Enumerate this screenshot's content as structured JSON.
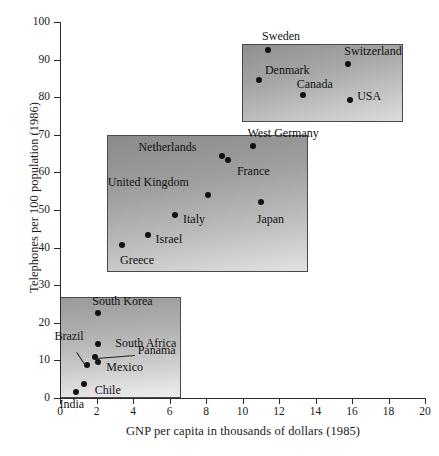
{
  "chart_data": {
    "type": "scatter",
    "title": "",
    "xlabel": "GNP per capita in thousands of dollars (1985)",
    "ylabel": "Telephones per 100 population (1986)",
    "xlim": [
      0,
      20
    ],
    "ylim": [
      0,
      100
    ],
    "xticks": [
      0,
      2,
      4,
      6,
      8,
      10,
      12,
      14,
      16,
      18,
      20
    ],
    "yticks": [
      0,
      10,
      20,
      30,
      40,
      50,
      60,
      70,
      80,
      90,
      100
    ],
    "grid": false,
    "legend": "none",
    "points": [
      {
        "label": "Sweden",
        "x": 11.4,
        "y": 92.5,
        "group": "high"
      },
      {
        "label": "Switzerland",
        "x": 15.8,
        "y": 88.8,
        "group": "high"
      },
      {
        "label": "Denmark",
        "x": 10.9,
        "y": 84.5,
        "group": "high"
      },
      {
        "label": "Canada",
        "x": 13.3,
        "y": 80.5,
        "group": "high"
      },
      {
        "label": "USA",
        "x": 15.9,
        "y": 79.2,
        "group": "high"
      },
      {
        "label": "West Germany",
        "x": 10.6,
        "y": 67.0,
        "group": "mid"
      },
      {
        "label": "Netherlands",
        "x": 8.9,
        "y": 64.4,
        "group": "mid"
      },
      {
        "label": "France",
        "x": 9.2,
        "y": 63.3,
        "group": "mid"
      },
      {
        "label": "United Kingdom",
        "x": 8.1,
        "y": 54.1,
        "group": "mid"
      },
      {
        "label": "Japan",
        "x": 11.0,
        "y": 52.1,
        "group": "mid"
      },
      {
        "label": "Italy",
        "x": 6.3,
        "y": 48.7,
        "group": "mid"
      },
      {
        "label": "Israel",
        "x": 4.8,
        "y": 43.4,
        "group": "mid"
      },
      {
        "label": "Greece",
        "x": 3.4,
        "y": 40.6,
        "group": "mid"
      },
      {
        "label": "South Korea",
        "x": 2.1,
        "y": 22.7,
        "group": "low"
      },
      {
        "label": "South Africa",
        "x": 2.1,
        "y": 14.3,
        "group": "low"
      },
      {
        "label": "Panama",
        "x": 1.9,
        "y": 10.9,
        "group": "low"
      },
      {
        "label": "Mexico",
        "x": 2.1,
        "y": 9.5,
        "group": "low"
      },
      {
        "label": "Brazil",
        "x": 1.5,
        "y": 8.7,
        "group": "low"
      },
      {
        "label": "Chile",
        "x": 1.3,
        "y": 3.6,
        "group": "low"
      },
      {
        "label": "India",
        "x": 0.9,
        "y": 1.7,
        "group": "low"
      }
    ],
    "groups": [
      {
        "name": "high-income",
        "members": [
          "Sweden",
          "Switzerland",
          "Denmark",
          "Canada",
          "USA"
        ]
      },
      {
        "name": "middle-income",
        "members": [
          "West Germany",
          "Netherlands",
          "France",
          "United Kingdom",
          "Japan",
          "Italy",
          "Israel",
          "Greece"
        ]
      },
      {
        "name": "low-income",
        "members": [
          "South Korea",
          "South Africa",
          "Panama",
          "Mexico",
          "Brazil",
          "Chile",
          "India"
        ]
      }
    ]
  },
  "colors": {
    "axis": "#2a2a2a",
    "point": "#111111",
    "text": "#1a1a1a",
    "box_border": "#4a4a4a"
  }
}
